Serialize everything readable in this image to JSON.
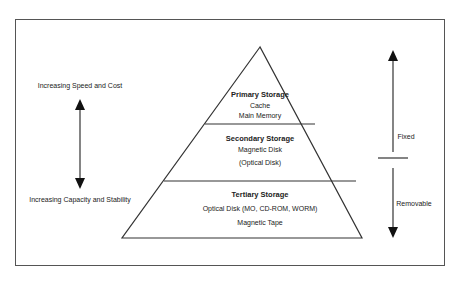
{
  "pyramid": {
    "primary": {
      "title": "Primary Storage",
      "items": [
        "Cache",
        "Main Memory"
      ]
    },
    "secondary": {
      "title": "Secondary Storage",
      "items": [
        "Magnetic Disk",
        "(Optical Disk)"
      ]
    },
    "tertiary": {
      "title": "Tertiary Storage",
      "items": [
        "Optical Disk (MO, CD-ROM, WORM)",
        "Magnetic Tape"
      ]
    }
  },
  "left_axis": {
    "top_label": "Increasing Speed and Cost",
    "bottom_label": "Increasing Capacity and Stability"
  },
  "right_axis": {
    "top_label": "Fixed",
    "bottom_label": "Removable"
  }
}
